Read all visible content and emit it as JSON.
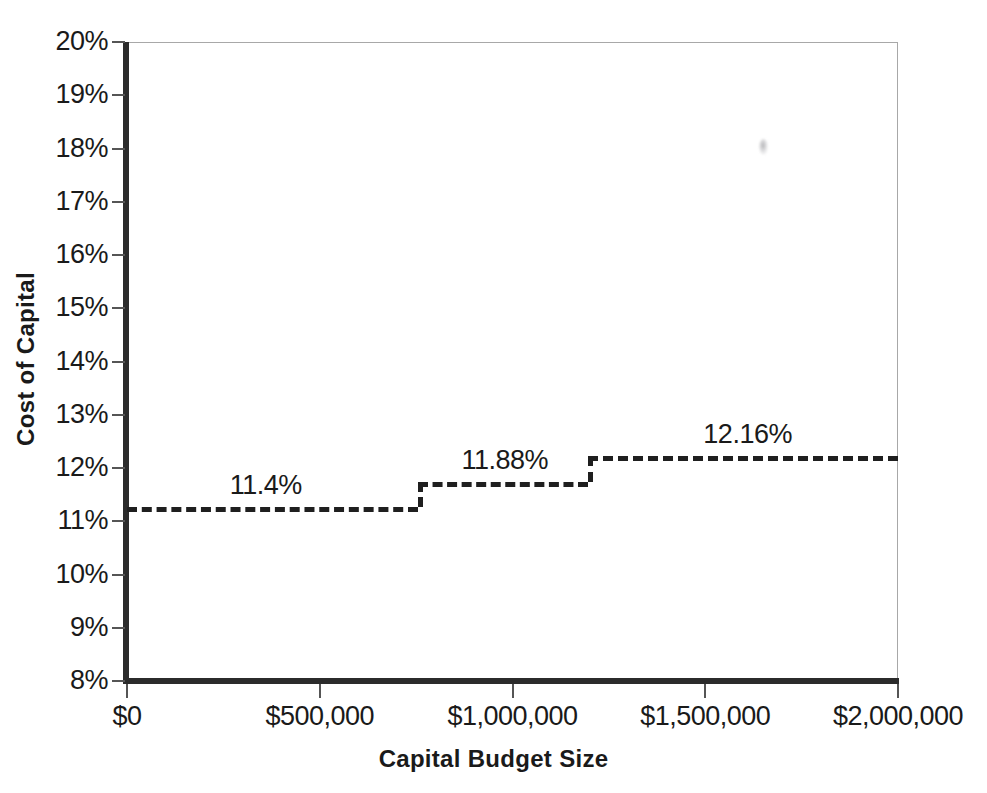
{
  "chart_data": {
    "type": "line",
    "subtype": "step",
    "title": "",
    "xlabel": "Capital Budget Size",
    "ylabel": "Cost of Capital",
    "xlim": [
      0,
      2000000
    ],
    "ylim": [
      8,
      20
    ],
    "grid": false,
    "legend": false,
    "x_tick_labels": [
      "$0",
      "$500,000",
      "$1,000,000",
      "$1,500,000",
      "$2,000,000"
    ],
    "x_tick_values": [
      0,
      500000,
      1000000,
      1500000,
      2000000
    ],
    "y_tick_labels": [
      "20%",
      "19%",
      "18%",
      "17%",
      "16%",
      "15%",
      "14%",
      "13%",
      "12%",
      "11%",
      "10%",
      "9%",
      "8%"
    ],
    "y_tick_values": [
      20,
      19,
      18,
      17,
      16,
      15,
      14,
      13,
      12,
      11,
      10,
      9,
      8
    ],
    "series": [
      {
        "name": "Marginal Cost of Capital",
        "style": "dashed",
        "color": "#1f1f1f",
        "steps": [
          {
            "x_start": 0,
            "x_end": 755000,
            "y": 11.27,
            "label": "11.4%",
            "label_x": 360000
          },
          {
            "x_start": 755000,
            "x_end": 1195000,
            "y": 11.74,
            "label": "11.88%",
            "label_x": 980000
          },
          {
            "x_start": 1195000,
            "x_end": 2000000,
            "y": 12.23,
            "label": "12.16%",
            "label_x": 1610000
          }
        ]
      }
    ],
    "annotations": [
      {
        "name": "scan-smudge",
        "x": 1670000,
        "y": 18.05,
        "text": ""
      }
    ]
  }
}
